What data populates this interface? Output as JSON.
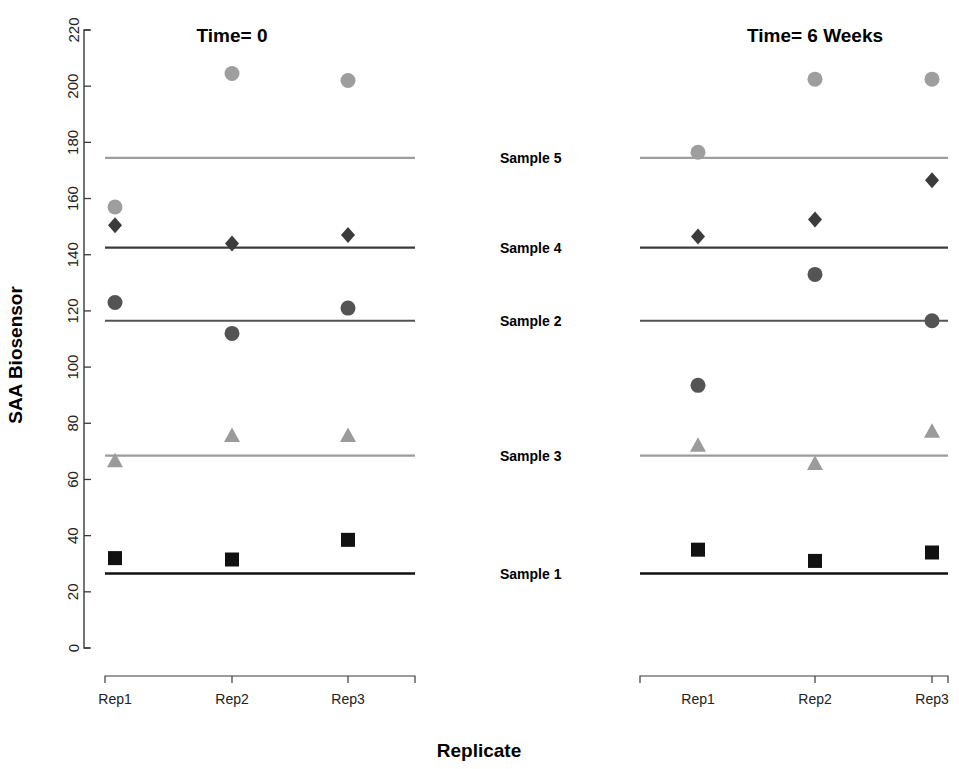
{
  "chart_data": {
    "type": "scatter",
    "title": "",
    "xlabel": "Replicate",
    "ylabel": "SAA Biosensor",
    "ylim": [
      0,
      220
    ],
    "ytick_labels": [
      "0",
      "20",
      "40",
      "60",
      "80",
      "100",
      "120",
      "140",
      "160",
      "180",
      "200",
      "220"
    ],
    "ytick_values": [
      0,
      20,
      40,
      60,
      80,
      100,
      120,
      140,
      160,
      180,
      200,
      220
    ],
    "grid": false,
    "legend_position": "center-inline",
    "categories": [
      "Rep1",
      "Rep2",
      "Rep3"
    ],
    "panels": [
      {
        "id": "panel-time-0",
        "title": "Time= 0"
      },
      {
        "id": "panel-time-6weeks",
        "title": "Time= 6 Weeks"
      }
    ],
    "series": [
      {
        "name": "Sample 5",
        "label": "Sample 5",
        "marker": "circle",
        "color": "#9e9e9e",
        "reference_line": 174.5,
        "values_time0": [
          157,
          204.5,
          202
        ],
        "values_time6weeks": [
          176.5,
          202.5,
          202.5
        ]
      },
      {
        "name": "Sample 4",
        "label": "Sample 4",
        "marker": "diamond",
        "color": "#3b3b3b",
        "reference_line": 142.5,
        "values_time0": [
          150.5,
          144,
          147
        ],
        "values_time6weeks": [
          146.5,
          152.5,
          166.5
        ]
      },
      {
        "name": "Sample 2",
        "label": "Sample 2",
        "marker": "circle",
        "color": "#545454",
        "reference_line": 116.5,
        "values_time0": [
          123,
          112,
          121
        ],
        "values_time6weeks": [
          93.5,
          133,
          116.5
        ]
      },
      {
        "name": "Sample 3",
        "label": "Sample 3",
        "marker": "triangle",
        "color": "#9b9b9b",
        "reference_line": 68.5,
        "values_time0": [
          66.5,
          75.5,
          75.5
        ],
        "values_time6weeks": [
          72,
          65.5,
          77
        ]
      },
      {
        "name": "Sample 1",
        "label": "Sample 1",
        "marker": "square",
        "color": "#111111",
        "reference_line": 26.5,
        "values_time0": [
          32,
          31.5,
          38.5
        ],
        "values_time6weeks": [
          35,
          31,
          34
        ]
      }
    ]
  },
  "axes": {
    "y_title": "SAA Biosensor",
    "x_title": "Replicate"
  },
  "panel_titles": {
    "left": "Time= 0",
    "right": "Time= 6 Weeks"
  },
  "xtick_labels": {
    "left": [
      "Rep1",
      "Rep2",
      "Rep3"
    ],
    "right": [
      "Rep1",
      "Rep2",
      "Rep3"
    ]
  },
  "series_labels": [
    "Sample 5",
    "Sample 4",
    "Sample 2",
    "Sample 3",
    "Sample 1"
  ],
  "colors": {
    "sample5": "#9e9e9e",
    "sample4": "#3b3b3b",
    "sample2": "#545454",
    "sample3": "#9b9b9b",
    "sample1": "#111111",
    "axis": "#3a3a3a",
    "background": "#ffffff"
  }
}
